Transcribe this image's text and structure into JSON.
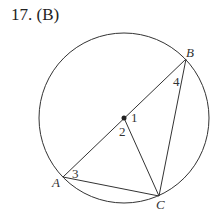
{
  "title": "17. (B)",
  "figure": {
    "type": "circle with inscribed triangle",
    "center_label": "",
    "points": {
      "A": "A",
      "B": "B",
      "C": "C"
    },
    "angle_labels": {
      "a1": "1",
      "a2": "2",
      "a3": "3",
      "a4": "4"
    },
    "stroke_color": "#333333"
  }
}
